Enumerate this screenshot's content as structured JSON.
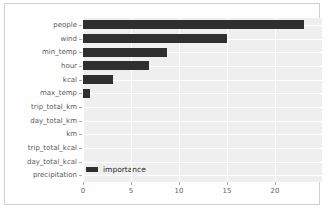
{
  "chart_data": {
    "type": "bar",
    "orientation": "horizontal",
    "title": "",
    "xlabel": "",
    "ylabel": "",
    "categories": [
      "people",
      "wind",
      "min_temp",
      "hour",
      "kcal",
      "max_temp",
      "trip_total_km",
      "day_total_km",
      "km",
      "trip_total_kcal",
      "day_total_kcal",
      "precipitation"
    ],
    "values": [
      23.0,
      15.0,
      8.8,
      6.9,
      3.1,
      0.7,
      0,
      0,
      0,
      0,
      0,
      0
    ],
    "series_name": "importance",
    "legend_label": "importance",
    "legend_position": "lower left",
    "x_ticks": [
      0,
      5,
      10,
      15,
      20
    ],
    "xlim": [
      0,
      24.9
    ],
    "grid": true,
    "bar_color": "#2f2f2f",
    "plot_bg_color": "#efefef",
    "grid_color": "#ffffff"
  }
}
